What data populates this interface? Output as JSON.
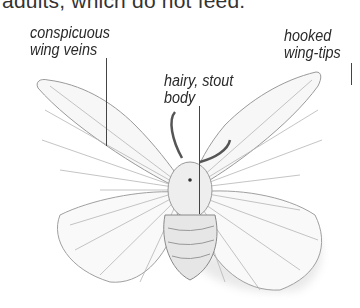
{
  "page": {
    "intro_text": "adults, which do not feed."
  },
  "figure": {
    "labels": [
      {
        "id": "wing-veins",
        "line1": "conspicuous",
        "line2": "wing veins"
      },
      {
        "id": "body",
        "line1": "hairy, stout",
        "line2": "body"
      },
      {
        "id": "wing-tips",
        "line1": "hooked",
        "line2": "wing-tips"
      }
    ]
  }
}
